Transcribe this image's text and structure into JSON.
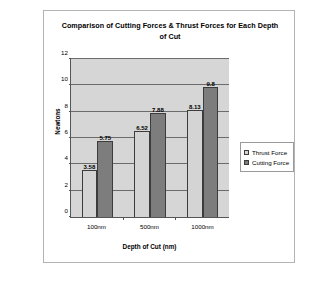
{
  "chart_data": {
    "type": "bar",
    "title": "Comparison of Cutting Forces & Thrust Forces for Each Depth of Cut",
    "title_line1": "Comparison of Cutting Forces & Thrust Forces for Each Depth",
    "title_line2": "of Cut",
    "xlabel": "Depth of Cut (nm)",
    "ylabel": "Newtons",
    "categories": [
      "100nm",
      "500nm",
      "1000nm"
    ],
    "ylim": [
      0,
      12
    ],
    "yticks": [
      0,
      2,
      4,
      6,
      8,
      10,
      12
    ],
    "ytick_labels": [
      "0",
      "2",
      "4",
      "6",
      "8",
      "10",
      "12"
    ],
    "grid": true,
    "grid_orientation": "horizontal",
    "legend_position": "right-outside",
    "plot_background": "#d6d6d6",
    "series": [
      {
        "name": "Thrust Force",
        "color": "#d4d4d4",
        "values": [
          3.58,
          6.52,
          8.13
        ],
        "labels": [
          "3.58",
          "6.52",
          "8.13"
        ]
      },
      {
        "name": "Cutting Force",
        "color": "#7d7d7d",
        "values": [
          5.75,
          7.88,
          9.9
        ],
        "labels": [
          "5.75",
          "7.88",
          "9.8"
        ]
      }
    ]
  }
}
